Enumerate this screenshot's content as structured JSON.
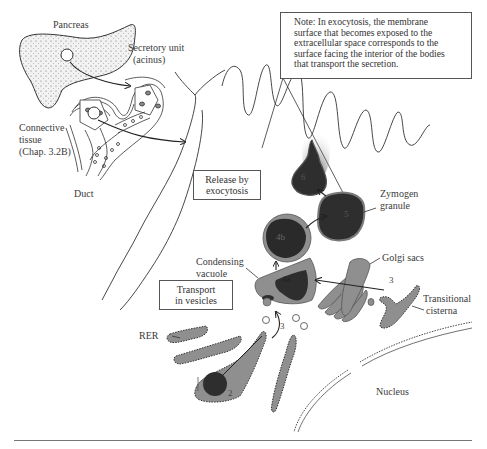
{
  "figure": {
    "labels": {
      "pancreas": "Pancreas",
      "secretory_unit": "Secretory unit\n(acinus)",
      "secretory_unit_line1": "Secretory unit",
      "secretory_unit_line2": "(acinus)",
      "connective_tissue_line1": "Connective",
      "connective_tissue_line2": "tissue",
      "connective_tissue_line3": "(Chap. 3.2B)",
      "duct": "Duct",
      "zymogen_line1": "Zymogen",
      "zymogen_line2": "granule",
      "golgi_sacs": "Golgi sacs",
      "condensing_line1": "Condensing",
      "condensing_line2": "vacuole",
      "transitional_line1": "Transitional",
      "transitional_line2": "cisterna",
      "rer": "RER",
      "nucleus": "Nucleus"
    },
    "boxes": {
      "release_line1": "Release by",
      "release_line2": "exocytosis",
      "transport_line1": "Transport",
      "transport_line2": "in vesicles"
    },
    "note": "Note:  In exocytosis, the membrane\nsurface that becomes exposed to the\nextracellular space corresponds to the\nsurface facing the interior of the bodies\nthat transport the secretion.",
    "step_numbers": {
      "step1": "1",
      "step2": "2",
      "step3_golgi": "3",
      "step3_vesicles": "3",
      "step4a": "4a",
      "step4b": "4b",
      "step5": "5",
      "step6": "6"
    },
    "colors": {
      "dark_granule": "#2e2e2e",
      "membrane_gray": "#8a8a8a",
      "light_gray": "#9a9a9a",
      "line": "#333333"
    }
  }
}
